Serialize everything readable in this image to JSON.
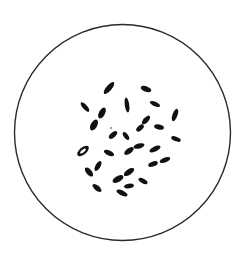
{
  "figure": {
    "background": "#ffffff",
    "field": {
      "cx": 122.5,
      "cy": 132.5,
      "r": 108,
      "stroke": "#2a2a2a",
      "stroke_width": 1.4
    },
    "chromosome_color": "#111111",
    "chromosomes": [
      {
        "id": 1,
        "cx": 109,
        "cy": 88,
        "len": 15,
        "wid": 5.5,
        "angle": -50
      },
      {
        "id": 2,
        "cx": 146,
        "cy": 89,
        "len": 11,
        "wid": 5.5,
        "angle": 20
      },
      {
        "id": 3,
        "cx": 85,
        "cy": 107,
        "len": 12,
        "wid": 4.5,
        "angle": 48
      },
      {
        "id": 4,
        "cx": 127,
        "cy": 105,
        "len": 15,
        "wid": 4.5,
        "angle": 82
      },
      {
        "id": 5,
        "cx": 155,
        "cy": 104,
        "len": 11,
        "wid": 4.5,
        "angle": 25
      },
      {
        "id": 6,
        "cx": 102,
        "cy": 113,
        "len": 12,
        "wid": 6,
        "angle": -62
      },
      {
        "id": 7,
        "cx": 94,
        "cy": 125,
        "len": 12,
        "wid": 6.5,
        "angle": -62
      },
      {
        "id": 8,
        "cx": 175,
        "cy": 115,
        "len": 13,
        "wid": 5,
        "angle": -70
      },
      {
        "id": 9,
        "cx": 146,
        "cy": 120,
        "len": 11,
        "wid": 5,
        "angle": -48
      },
      {
        "id": 10,
        "cx": 140,
        "cy": 128,
        "len": 9,
        "wid": 5,
        "angle": -42
      },
      {
        "id": 11,
        "cx": 159,
        "cy": 127,
        "len": 10,
        "wid": 5,
        "angle": 15
      },
      {
        "id": 12,
        "cx": 113,
        "cy": 135,
        "len": 10,
        "wid": 5,
        "angle": -40
      },
      {
        "id": 13,
        "cx": 126,
        "cy": 136,
        "len": 9,
        "wid": 4.5,
        "angle": 55
      },
      {
        "id": 14,
        "cx": 176,
        "cy": 139,
        "len": 10,
        "wid": 4.5,
        "angle": 20
      },
      {
        "id": 15,
        "cx": 83,
        "cy": 151,
        "len": 14,
        "wid": 7,
        "angle": -40,
        "ring": true
      },
      {
        "id": 16,
        "cx": 109,
        "cy": 153,
        "len": 11,
        "wid": 5,
        "angle": 25
      },
      {
        "id": 17,
        "cx": 129,
        "cy": 151,
        "len": 11,
        "wid": 5.5,
        "angle": -35
      },
      {
        "id": 18,
        "cx": 139,
        "cy": 146,
        "len": 11,
        "wid": 5,
        "angle": -15
      },
      {
        "id": 19,
        "cx": 155,
        "cy": 149,
        "len": 12,
        "wid": 5,
        "angle": -25
      },
      {
        "id": 20,
        "cx": 89,
        "cy": 172,
        "len": 11,
        "wid": 5.5,
        "angle": 50
      },
      {
        "id": 21,
        "cx": 98,
        "cy": 166,
        "len": 11,
        "wid": 5,
        "angle": -60
      },
      {
        "id": 22,
        "cx": 118,
        "cy": 179,
        "len": 12,
        "wid": 6,
        "angle": -30
      },
      {
        "id": 23,
        "cx": 129,
        "cy": 172,
        "len": 12,
        "wid": 5.5,
        "angle": -35
      },
      {
        "id": 24,
        "cx": 153,
        "cy": 164,
        "len": 10,
        "wid": 5,
        "angle": -20
      },
      {
        "id": 25,
        "cx": 165,
        "cy": 160,
        "len": 11,
        "wid": 5,
        "angle": -20
      },
      {
        "id": 26,
        "cx": 143,
        "cy": 181,
        "len": 10,
        "wid": 4.5,
        "angle": 30
      },
      {
        "id": 27,
        "cx": 97,
        "cy": 188,
        "len": 11,
        "wid": 5,
        "angle": 40
      },
      {
        "id": 28,
        "cx": 129,
        "cy": 186,
        "len": 10,
        "wid": 4.5,
        "angle": -10
      },
      {
        "id": 29,
        "cx": 122,
        "cy": 193,
        "len": 12,
        "wid": 5,
        "angle": 25
      },
      {
        "id": 30,
        "cx": 111,
        "cy": 128,
        "len": 1.5,
        "wid": 1.5,
        "angle": 0
      }
    ]
  }
}
